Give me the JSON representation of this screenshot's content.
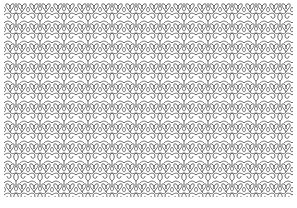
{
  "image": {
    "description": "Repeating ornamental lace / lattice pattern of interlocking curls and heart-like loops, gray lines on white",
    "colors": {
      "background": "#ffffff",
      "line": "#555555"
    },
    "motif_icon": "lace-scroll-motif"
  }
}
